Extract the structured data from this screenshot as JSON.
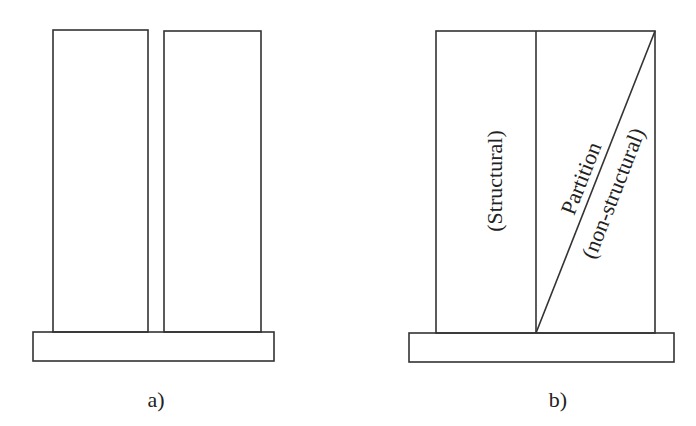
{
  "panels": [
    {
      "id": "a",
      "caption": "a)",
      "description": "Two separate walls standing side by side on a common base"
    },
    {
      "id": "b",
      "caption": "b)",
      "description": "Single wall divided into structural and partition portions",
      "labels": {
        "structural": "(Structural)",
        "partition": "Partition",
        "non_structural": "(non-structural)"
      }
    }
  ],
  "colors": {
    "line": "#333333",
    "text": "#222222",
    "background": "#ffffff"
  }
}
